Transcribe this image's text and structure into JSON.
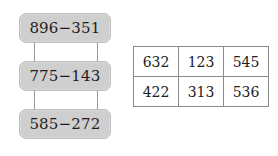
{
  "chain": {
    "boxes": [
      {
        "expression": "896−351"
      },
      {
        "expression": "775−143"
      },
      {
        "expression": "585−272"
      }
    ]
  },
  "table": {
    "rows": [
      [
        "632",
        "123",
        "545"
      ],
      [
        "422",
        "313",
        "536"
      ]
    ]
  },
  "colors": {
    "box_fill": "#cfcfcf",
    "box_border": "#bdbdbd",
    "table_border": "#8a8a8a"
  }
}
